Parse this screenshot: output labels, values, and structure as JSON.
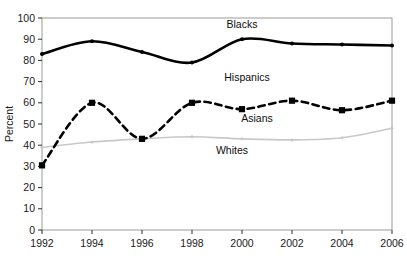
{
  "chart_data": {
    "type": "line",
    "title": "",
    "xlabel": "",
    "ylabel": "Percent",
    "categories": [
      "1992",
      "1994",
      "1996",
      "1998",
      "2000",
      "2002",
      "2004",
      "2006"
    ],
    "x": [
      1992,
      1994,
      1996,
      1998,
      2000,
      2002,
      2004,
      2006
    ],
    "xlim": [
      1992,
      2006
    ],
    "ylim": [
      0,
      100
    ],
    "ytick_labels": [
      "0",
      "10",
      "20",
      "30",
      "40",
      "50",
      "60",
      "70",
      "80",
      "90",
      "100"
    ],
    "ytick_values": [
      0,
      10,
      20,
      30,
      40,
      50,
      60,
      70,
      80,
      90,
      100
    ],
    "grid": false,
    "legend_position": "inline-annotations",
    "series": [
      {
        "name": "Blacks",
        "color": "#000000",
        "style": "solid",
        "marker": "dot",
        "values": [
          83,
          89,
          84,
          79,
          90,
          88,
          87.5,
          87
        ]
      },
      {
        "name": "Hispanics",
        "color": "#000000",
        "style": "dashed",
        "marker": "square",
        "values": [
          30.5,
          60,
          43,
          60,
          57,
          61,
          56.5,
          61
        ]
      },
      {
        "name": "Whites",
        "color": "#c8c8c8",
        "style": "solid",
        "marker": "dot",
        "values": [
          39,
          41.5,
          43,
          44,
          43,
          42.5,
          43.5,
          48
        ]
      }
    ],
    "annotations": [
      {
        "text": "Blacks",
        "x": 2000.0,
        "y": 95.5
      },
      {
        "text": "Hispanics",
        "x": 2000.2,
        "y": 70.5
      },
      {
        "text": "Asians",
        "x": 2000.6,
        "y": 51.0
      },
      {
        "text": "Whites",
        "x": 1999.6,
        "y": 36.0
      }
    ]
  },
  "axes": {
    "ylabel": "Percent"
  }
}
